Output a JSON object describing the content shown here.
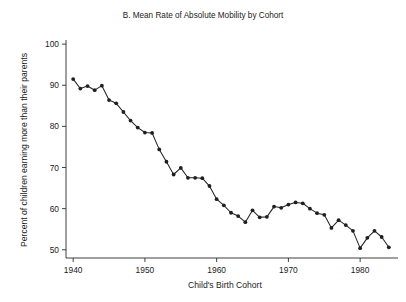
{
  "figure": {
    "title": "B. Mean Rate of Absolute Mobility by Cohort",
    "xlabel": "Child's Birth Cohort",
    "ylabel": "Percent of children earning more than their parents",
    "background_color": "#ffffff",
    "line_color": "#252525",
    "marker_color": "#1f1f1f",
    "axis_color": "#2b2b2b"
  },
  "chart_data": {
    "type": "line",
    "title": "B. Mean Rate of Absolute Mobility by Cohort",
    "xlabel": "Child's Birth Cohort",
    "ylabel": "Percent of children earning more than their parents",
    "xlim": [
      1939,
      1985
    ],
    "ylim": [
      48,
      101
    ],
    "xticks": [
      1940,
      1950,
      1960,
      1970,
      1980
    ],
    "xticklabels": [
      "1940",
      "1950",
      "1960",
      "1970",
      "1980"
    ],
    "yticks": [
      50,
      60,
      70,
      80,
      90,
      100
    ],
    "yticklabels": [
      "50",
      "60",
      "70",
      "80",
      "90",
      "100"
    ],
    "grid": false,
    "legend": false,
    "marker": "circle",
    "x": [
      1940,
      1941,
      1942,
      1943,
      1944,
      1945,
      1946,
      1947,
      1948,
      1949,
      1950,
      1951,
      1952,
      1953,
      1954,
      1955,
      1956,
      1957,
      1958,
      1959,
      1960,
      1961,
      1962,
      1963,
      1964,
      1965,
      1966,
      1967,
      1968,
      1969,
      1970,
      1971,
      1972,
      1973,
      1974,
      1975,
      1976,
      1977,
      1978,
      1979,
      1980,
      1981,
      1982,
      1983,
      1984
    ],
    "values": [
      91.5,
      89.2,
      89.8,
      88.8,
      89.9,
      86.4,
      85.6,
      83.5,
      81.4,
      79.7,
      78.5,
      78.4,
      74.4,
      71.4,
      68.3,
      69.9,
      67.5,
      67.5,
      67.4,
      65.5,
      62.3,
      60.8,
      59.0,
      58.2,
      56.7,
      59.6,
      57.9,
      58.0,
      60.5,
      60.2,
      61.0,
      61.5,
      61.3,
      60.0,
      58.9,
      58.5,
      55.3,
      57.2,
      56.0,
      54.6,
      50.4,
      52.9,
      54.6,
      53.1,
      50.6
    ],
    "series": [
      {
        "name": "Mean rate of absolute mobility",
        "values": [
          91.5,
          89.2,
          89.8,
          88.8,
          89.9,
          86.4,
          85.6,
          83.5,
          81.4,
          79.7,
          78.5,
          78.4,
          74.4,
          71.4,
          68.3,
          69.9,
          67.5,
          67.5,
          67.4,
          65.5,
          62.3,
          60.8,
          59.0,
          58.2,
          56.7,
          59.6,
          57.9,
          58.0,
          60.5,
          60.2,
          61.0,
          61.5,
          61.3,
          60.0,
          58.9,
          58.5,
          55.3,
          57.2,
          56.0,
          54.6,
          50.4,
          52.9,
          54.6,
          53.1,
          50.6
        ]
      }
    ]
  }
}
